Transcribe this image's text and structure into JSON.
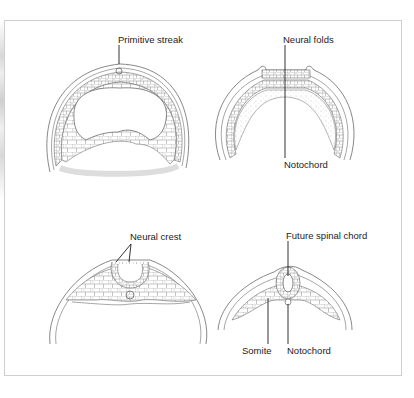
{
  "figure": {
    "panels": [
      {
        "id": "primitive-streak-stage",
        "labels": [
          {
            "text": "Primitive streak"
          }
        ]
      },
      {
        "id": "neural-folds-stage",
        "labels": [
          {
            "text": "Neural folds"
          },
          {
            "text": "Notochord"
          }
        ]
      },
      {
        "id": "neural-crest-stage",
        "labels": [
          {
            "text": "Neural crest"
          }
        ]
      },
      {
        "id": "neural-tube-stage",
        "labels": [
          {
            "text": "Future spinal chord"
          },
          {
            "text": "Somite"
          },
          {
            "text": "Notochord"
          }
        ]
      }
    ],
    "colors": {
      "line": "#1c1c1c",
      "cell_outline": "#6a6a6a",
      "frame": "#cfcfcf",
      "background": "#ffffff"
    }
  }
}
